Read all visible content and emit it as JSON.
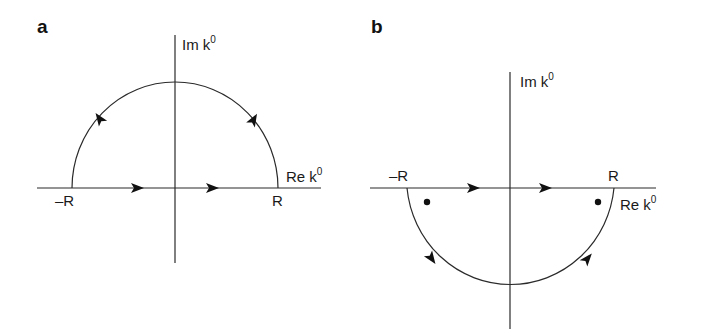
{
  "figure": {
    "panels": [
      {
        "id": "a",
        "label": "a",
        "description": "Contour closed in the upper half-plane",
        "axis_labels": {
          "imaginary": "Im k",
          "imaginary_sup": "0",
          "real": "Re k",
          "real_sup": "0"
        },
        "points": {
          "minus_r": "–R",
          "plus_r": "R"
        },
        "contour": "upper semicircle, counterclockwise",
        "poles_shown": 0
      },
      {
        "id": "b",
        "label": "b",
        "description": "Contour closed in the lower half-plane",
        "axis_labels": {
          "imaginary": "Im k",
          "imaginary_sup": "0",
          "real": "Re k",
          "real_sup": "0"
        },
        "points": {
          "minus_r": "–R",
          "plus_r": "R"
        },
        "contour": "lower semicircle, clockwise",
        "poles_shown": 2
      }
    ],
    "colors": {
      "line": "#2a2a2a",
      "arrow": "#111111",
      "text": "#1a1a1a"
    }
  }
}
